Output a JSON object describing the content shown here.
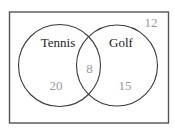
{
  "diagram": {
    "type": "venn",
    "universe": {
      "outside_count": "12"
    },
    "sets": [
      {
        "name": "Tennis",
        "only_count": "20"
      },
      {
        "name": "Golf",
        "only_count": "15"
      }
    ],
    "intersection_count": "8",
    "colors": {
      "outline": "#3a3a3a",
      "border": "#555555",
      "set_label": "#1a1a1a",
      "count_label": "#9a9a9a"
    }
  }
}
